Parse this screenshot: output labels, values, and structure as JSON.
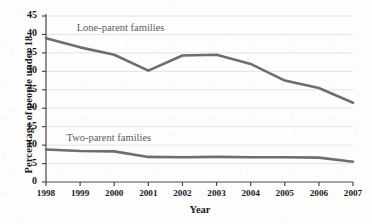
{
  "chart_data": {
    "type": "line",
    "title": "",
    "xlabel": "Year",
    "ylabel": "Percentage of people under 18",
    "x": [
      1998,
      1999,
      2000,
      2001,
      2002,
      2003,
      2004,
      2005,
      2006,
      2007
    ],
    "xtick_labels": [
      "1998",
      "1999",
      "2000",
      "2001",
      "2002",
      "2003",
      "2004",
      "2005",
      "2006",
      "2007"
    ],
    "ytick_labels": [
      "0",
      "5",
      "10",
      "15",
      "20",
      "25",
      "30",
      "35",
      "40",
      "45"
    ],
    "yticks": [
      0,
      5,
      10,
      15,
      20,
      25,
      30,
      35,
      40,
      45
    ],
    "ylim": [
      0,
      45
    ],
    "xlim": [
      1998,
      2007
    ],
    "grid": true,
    "grid_axis": "y",
    "legend": "inline-annotations",
    "series": [
      {
        "name": "Lone-parent families",
        "label_x": 1998.9,
        "label_y": 41.3,
        "color": "#6e6e6e",
        "values": [
          39.0,
          36.5,
          34.5,
          30.2,
          34.3,
          34.5,
          32.0,
          27.5,
          25.5,
          21.5
        ]
      },
      {
        "name": "Two-parent families",
        "label_x": 1998.6,
        "label_y": 11.5,
        "color": "#6e6e6e",
        "values": [
          8.8,
          8.4,
          8.3,
          6.8,
          6.7,
          6.8,
          6.7,
          6.7,
          6.6,
          5.5
        ]
      }
    ],
    "colors": {
      "line": "#6e6e6e",
      "axis": "#4a4a4a",
      "grid": "#e4e4e2",
      "text": "#1a1a1a",
      "annotation": "#5c5c5c",
      "background": "#fdfdfc"
    }
  }
}
